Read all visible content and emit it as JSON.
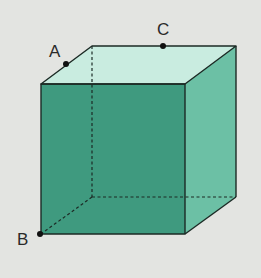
{
  "figure": {
    "type": "cube",
    "labels": {
      "A": "A",
      "B": "B",
      "C": "C"
    },
    "colors": {
      "background": "#e3e4e1",
      "top_face": "#c9ece0",
      "front_face": "#3f9a7f",
      "right_face": "#6cc0a5",
      "edge": "#1c2a25",
      "point": "#111111"
    },
    "points": {
      "A": {
        "description": "midpoint of top-left edge",
        "x": 66,
        "y": 64
      },
      "B": {
        "description": "front-bottom-left vertex",
        "x": 40,
        "y": 234
      },
      "C": {
        "description": "point on back-top edge",
        "x": 163,
        "y": 46
      }
    }
  }
}
